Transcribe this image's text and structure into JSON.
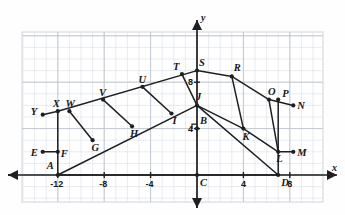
{
  "figure": {
    "kind": "coordinate-geometry-diagram",
    "colors": {
      "background": "#fefefe",
      "grid_minor": "#dfe3e8",
      "grid_major": "#c3c9d1",
      "axis": "#1d1f22",
      "shape_stroke": "#1d1f22",
      "label_text": "#16171a",
      "plot_border": "#cfd4da"
    }
  },
  "axes": {
    "x_axis_name": "x",
    "y_axis_name": "y",
    "origin_label": "C",
    "x_ticks": [
      {
        "label": "-12",
        "value": -12
      },
      {
        "label": "-8",
        "value": -8
      },
      {
        "label": "-4",
        "value": -4
      },
      {
        "label": "4",
        "value": 4
      },
      {
        "label": "8",
        "value": 8
      }
    ],
    "y_ticks": [
      {
        "label": "4",
        "value": 4
      },
      {
        "label": "8",
        "value": 8
      }
    ],
    "x_range": [
      -14,
      10
    ],
    "y_range": [
      -2,
      11
    ],
    "grid": true
  },
  "points": [
    {
      "id": "A",
      "label": "A",
      "x": -12,
      "y": 0
    },
    {
      "id": "B",
      "label": "B",
      "x": 0,
      "y": 4
    },
    {
      "id": "C",
      "label": "C",
      "x": 0,
      "y": 0
    },
    {
      "id": "D",
      "label": "D",
      "x": 7,
      "y": 0
    },
    {
      "id": "E",
      "label": "E",
      "x": -13.3,
      "y": 2
    },
    {
      "id": "F",
      "label": "F",
      "x": -12,
      "y": 2
    },
    {
      "id": "G",
      "label": "G",
      "x": -9,
      "y": 3
    },
    {
      "id": "H",
      "label": "H",
      "x": -5.6,
      "y": 4.2
    },
    {
      "id": "I",
      "label": "I",
      "x": -2.2,
      "y": 5.3
    },
    {
      "id": "J",
      "label": "J",
      "x": 0,
      "y": 6
    },
    {
      "id": "K",
      "label": "K",
      "x": 4,
      "y": 4
    },
    {
      "id": "L",
      "label": "L",
      "x": 7,
      "y": 2
    },
    {
      "id": "M",
      "label": "M",
      "x": 8.3,
      "y": 2
    },
    {
      "id": "N",
      "label": "N",
      "x": 8.3,
      "y": 6
    },
    {
      "id": "O",
      "label": "O",
      "x": 6.2,
      "y": 6.5
    },
    {
      "id": "P",
      "label": "P",
      "x": 7,
      "y": 6.5
    },
    {
      "id": "R",
      "label": "R",
      "x": 3,
      "y": 8.5
    },
    {
      "id": "S",
      "label": "S",
      "x": 0,
      "y": 9
    },
    {
      "id": "T",
      "label": "T",
      "x": -1.3,
      "y": 8.7
    },
    {
      "id": "U",
      "label": "U",
      "x": -4.7,
      "y": 7.6
    },
    {
      "id": "V",
      "label": "V",
      "x": -8.1,
      "y": 6.5
    },
    {
      "id": "W",
      "label": "W",
      "x": -11,
      "y": 5.5
    },
    {
      "id": "X",
      "label": "X",
      "x": -12,
      "y": 5.5
    },
    {
      "id": "Y",
      "label": "Y",
      "x": -13.3,
      "y": 5.2
    }
  ],
  "label_offsets": {
    "A": {
      "dx": -11,
      "dy": -14
    },
    "B": {
      "dx": 3,
      "dy": -13
    },
    "C": {
      "dx": 3,
      "dy": 3
    },
    "D": {
      "dx": 3,
      "dy": 3
    },
    "E": {
      "dx": -12,
      "dy": -4
    },
    "F": {
      "dx": 3,
      "dy": -3
    },
    "G": {
      "dx": -1,
      "dy": 3
    },
    "H": {
      "dx": -2,
      "dy": 3
    },
    "I": {
      "dx": 1,
      "dy": 2
    },
    "J": {
      "dx": -1,
      "dy": -13
    },
    "K": {
      "dx": -1,
      "dy": 3
    },
    "L": {
      "dx": -2,
      "dy": 2
    },
    "M": {
      "dx": 4,
      "dy": -4
    },
    "N": {
      "dx": 4,
      "dy": -4
    },
    "O": {
      "dx": -1,
      "dy": -13
    },
    "P": {
      "dx": 4,
      "dy": -11
    },
    "R": {
      "dx": 2,
      "dy": -13
    },
    "S": {
      "dx": 2,
      "dy": -13
    },
    "T": {
      "dx": -9,
      "dy": -12
    },
    "U": {
      "dx": -4,
      "dy": -12
    },
    "V": {
      "dx": -4,
      "dy": -12
    },
    "W": {
      "dx": -4,
      "dy": -12
    },
    "X": {
      "dx": -5,
      "dy": -12
    },
    "Y": {
      "dx": -12,
      "dy": -8
    }
  },
  "segments": [
    {
      "name": "lower-rail-A-J",
      "from": "A",
      "to": "J"
    },
    {
      "name": "upper-rail-X-S",
      "from": "X",
      "to": "S"
    },
    {
      "name": "base-A-D",
      "from": "A",
      "to": "D"
    },
    {
      "name": "stile-A-X",
      "from": "A",
      "to": "X"
    },
    {
      "name": "guide-Y-X",
      "from": "Y",
      "to": "X"
    },
    {
      "name": "guide-E-F",
      "from": "E",
      "to": "F"
    },
    {
      "name": "rung-W-G",
      "from": "W",
      "to": "G"
    },
    {
      "name": "rung-V-H",
      "from": "V",
      "to": "H"
    },
    {
      "name": "rung-U-I",
      "from": "U",
      "to": "I"
    },
    {
      "name": "rung-T-J",
      "from": "T",
      "to": "J"
    },
    {
      "name": "upper-fly-S-R",
      "from": "S",
      "to": "R"
    },
    {
      "name": "fly-rail-R-O",
      "from": "R",
      "to": "O"
    },
    {
      "name": "lower-fly-J-K",
      "from": "J",
      "to": "K"
    },
    {
      "name": "fly-rail-K-L",
      "from": "K",
      "to": "L"
    },
    {
      "name": "rung-R-K",
      "from": "R",
      "to": "K"
    },
    {
      "name": "rung-O-L",
      "from": "O",
      "to": "L"
    },
    {
      "name": "stile-P-D",
      "from": "P",
      "to": "D"
    },
    {
      "name": "guide-O-N",
      "from": "O",
      "to": "N"
    },
    {
      "name": "guide-L-M",
      "from": "L",
      "to": "M"
    },
    {
      "name": "base-D-J",
      "from": "D",
      "to": "J"
    }
  ],
  "right_angle_markers": [
    {
      "name": "right-angle-at-B",
      "at": "B"
    }
  ]
}
